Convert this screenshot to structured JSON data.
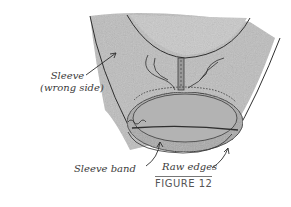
{
  "figure": {
    "caption": "FIGURE 12",
    "labels": {
      "sleeve_line1": "Sleeve",
      "sleeve_line2": "(wrong side)",
      "sleeve_band": "Sleeve band",
      "raw_edges": "Raw edges"
    }
  },
  "colors": {
    "fabric": "#b9b9b9",
    "fabric_dark": "#8f8f8f",
    "ink": "#2f2f2f",
    "background": "#ffffff"
  }
}
